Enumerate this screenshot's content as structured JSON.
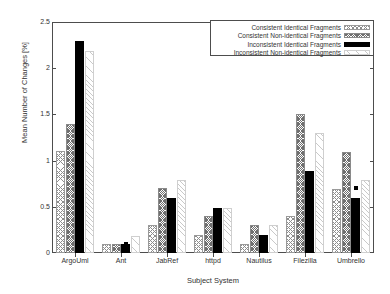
{
  "chart_data": {
    "type": "bar",
    "title": "",
    "xlabel": "Subject System",
    "ylabel": "Mean Number of Changes [%]",
    "categories": [
      "ArgoUml",
      "Ant",
      "JabRef",
      "httpd",
      "Nautilus",
      "Filezilla",
      "Umbrello"
    ],
    "ylim": [
      0,
      2.5
    ],
    "yticks": [
      "0",
      "0.5",
      "1",
      "1.5",
      "2",
      "2.5"
    ],
    "ytick_values": [
      0,
      0.5,
      1,
      1.5,
      2,
      2.5
    ],
    "grid": false,
    "legend_position": "top-right",
    "series": [
      {
        "name": "Consistent Identical Fragments",
        "pattern": "light-crosshatch",
        "values": [
          1.1,
          0.1,
          0.3,
          0.2,
          0.1,
          0.4,
          0.69
        ]
      },
      {
        "name": "Consistent Non-identical Fragments",
        "pattern": "dense-stipple",
        "values": [
          1.4,
          0.1,
          0.7,
          0.4,
          0.3,
          1.5,
          1.09
        ]
      },
      {
        "name": "Inconsistent Identical Fragments",
        "pattern": "solid-black",
        "values": [
          2.29,
          0.1,
          0.6,
          0.49,
          0.19,
          0.89,
          0.59
        ],
        "markers": [
          1.1,
          0.1,
          0.3,
          0.2,
          0.1,
          0.4,
          0.7
        ]
      },
      {
        "name": "Inconsistent Non-identical Fragments",
        "pattern": "faint-diagonal",
        "values": [
          2.19,
          0.18,
          0.79,
          0.49,
          0.3,
          1.3,
          0.79
        ]
      }
    ]
  },
  "axes": {
    "y_title": "Mean Number of Changes [%]",
    "x_title": "Subject System"
  },
  "legend": {
    "items": [
      {
        "label": "Consistent Identical Fragments"
      },
      {
        "label": "Consistent Non-identical Fragments"
      },
      {
        "label": "Inconsistent Identical Fragments"
      },
      {
        "label": "Inconsistent Non-identical Fragments"
      }
    ]
  },
  "colors": {
    "frame": "#4d4d4d",
    "text": "#333333",
    "series3": "#000000",
    "background": "#ffffff"
  }
}
